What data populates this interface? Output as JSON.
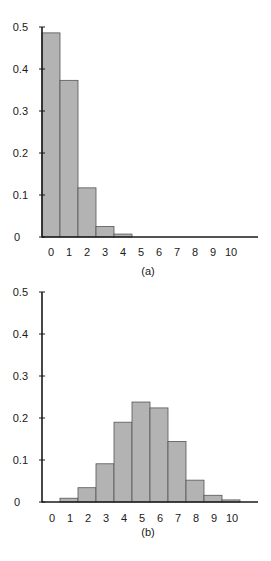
{
  "chart_data": [
    {
      "type": "bar",
      "title": "",
      "caption": "(a)",
      "xlabel": "",
      "ylabel": "",
      "categories": [
        "0",
        "1",
        "2",
        "3",
        "4",
        "5",
        "6",
        "7",
        "8",
        "9",
        "10"
      ],
      "values": [
        0.486,
        0.373,
        0.117,
        0.025,
        0.007,
        0,
        0,
        0,
        0,
        0,
        0
      ],
      "yticks": [
        "0",
        "0.1",
        "0.2",
        "0.3",
        "0.4",
        "0.5"
      ],
      "ylim": [
        0,
        0.5
      ],
      "grid": false,
      "legend": null,
      "bar_color": "#b3b3b3",
      "edge_color": "#555555"
    },
    {
      "type": "bar",
      "title": "",
      "caption": "(b)",
      "xlabel": "",
      "ylabel": "",
      "categories": [
        "0",
        "1",
        "2",
        "3",
        "4",
        "5",
        "6",
        "7",
        "8",
        "9",
        "10"
      ],
      "values": [
        0,
        0.009,
        0.034,
        0.091,
        0.19,
        0.238,
        0.224,
        0.144,
        0.052,
        0.016,
        0.005
      ],
      "yticks": [
        "0",
        "0.1",
        "0.2",
        "0.3",
        "0.4",
        "0.5"
      ],
      "ylim": [
        0,
        0.5
      ],
      "grid": false,
      "legend": null,
      "bar_color": "#b3b3b3",
      "edge_color": "#555555"
    }
  ]
}
